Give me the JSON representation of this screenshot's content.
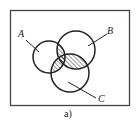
{
  "diagram": {
    "type": "venn",
    "frame": {
      "x": 10,
      "y": 10,
      "width": 119,
      "height": 95,
      "stroke": "#444444"
    },
    "sets": [
      {
        "label": "A",
        "cx": 49,
        "cy": 57,
        "r": 16,
        "label_x": 18,
        "label_y": 37,
        "leader": [
          26,
          40,
          39,
          52
        ]
      },
      {
        "label": "B",
        "cx": 76,
        "cy": 50,
        "r": 19,
        "label_x": 107,
        "label_y": 33,
        "leader": [
          107,
          34,
          88,
          46
        ]
      },
      {
        "label": "C",
        "cx": 70,
        "cy": 73,
        "r": 19,
        "label_x": 99,
        "label_y": 101,
        "leader": [
          68,
          82,
          96,
          98
        ]
      }
    ],
    "shaded_region": "pairwise intersections (A∩B) ∪ (A∩C) ∪ (B∩C)",
    "hatch": "diagonal",
    "caption": "a)",
    "stroke_color": "#222222"
  }
}
